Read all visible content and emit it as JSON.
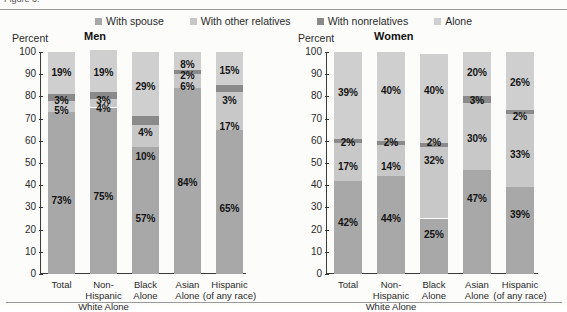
{
  "clipped_top_text": "Figure 3.",
  "legend": {
    "items": [
      {
        "label": "With spouse",
        "color": "#a8a8a8"
      },
      {
        "label": "With other relatives",
        "color": "#c8c8c8"
      },
      {
        "label": "With nonrelatives",
        "color": "#8a8a8a"
      },
      {
        "label": "Alone",
        "color": "#cfcfcf"
      }
    ]
  },
  "chart_data": [
    {
      "type": "bar",
      "title": "Men",
      "ylabel": "Percent",
      "xlabel": "",
      "ylim": [
        0,
        100
      ],
      "yticks": [
        0,
        10,
        20,
        30,
        40,
        50,
        60,
        70,
        80,
        90,
        100
      ],
      "grid": false,
      "stacked": true,
      "legend_position": "top-center",
      "categories": [
        "Total",
        "Non-Hispanic\nWhite Alone",
        "Black\nAlone",
        "Asian\nAlone",
        "Hispanic\n(of any race)"
      ],
      "series": [
        {
          "name": "With spouse",
          "color": "#a8a8a8",
          "values": [
            73,
            75,
            57,
            84,
            65
          ]
        },
        {
          "name": "With other relatives",
          "color": "#c8c8c8",
          "values": [
            5,
            4,
            10,
            6,
            17
          ]
        },
        {
          "name": "With nonrelatives",
          "color": "#8a8a8a",
          "values": [
            3,
            3,
            4,
            2,
            3
          ]
        },
        {
          "name": "Alone",
          "color": "#cfcfcf",
          "values": [
            19,
            19,
            29,
            8,
            15
          ]
        }
      ],
      "labels": [
        [
          "73%",
          "75%",
          "57%",
          "84%",
          "65%"
        ],
        [
          "5%",
          "4%",
          "10%",
          "6%",
          "17%"
        ],
        [
          "3%",
          "3%",
          "4%",
          "2%",
          "3%"
        ],
        [
          "19%",
          "19%",
          "29%",
          "8%",
          "15%"
        ]
      ]
    },
    {
      "type": "bar",
      "title": "Women",
      "ylabel": "Percent",
      "xlabel": "",
      "ylim": [
        0,
        100
      ],
      "yticks": [
        0,
        10,
        20,
        30,
        40,
        50,
        60,
        70,
        80,
        90,
        100
      ],
      "grid": false,
      "stacked": true,
      "legend_position": "top-center",
      "categories": [
        "Total",
        "Non-Hispanic\nWhite Alone",
        "Black\nAlone",
        "Asian\nAlone",
        "Hispanic\n(of any race)"
      ],
      "series": [
        {
          "name": "With spouse",
          "color": "#a8a8a8",
          "values": [
            42,
            44,
            25,
            47,
            39
          ]
        },
        {
          "name": "With other relatives",
          "color": "#c8c8c8",
          "values": [
            17,
            14,
            32,
            30,
            33
          ]
        },
        {
          "name": "With nonrelatives",
          "color": "#8a8a8a",
          "values": [
            2,
            2,
            2,
            3,
            2
          ]
        },
        {
          "name": "Alone",
          "color": "#cfcfcf",
          "values": [
            39,
            40,
            40,
            20,
            26
          ]
        }
      ],
      "labels": [
        [
          "42%",
          "44%",
          "25%",
          "47%",
          "39%"
        ],
        [
          "17%",
          "14%",
          "32%",
          "30%",
          "33%"
        ],
        [
          "2%",
          "2%",
          "2%",
          "3%",
          "2%"
        ],
        [
          "39%",
          "40%",
          "40%",
          "20%",
          "26%"
        ]
      ]
    }
  ]
}
